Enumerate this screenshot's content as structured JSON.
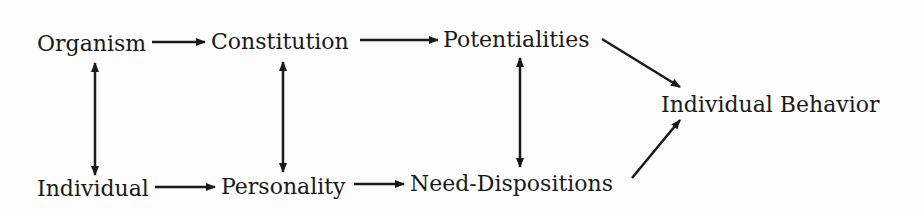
{
  "diagram": {
    "nodes": [
      {
        "id": "organism",
        "label": "Organism"
      },
      {
        "id": "constitution",
        "label": "Constitution"
      },
      {
        "id": "potentialities",
        "label": "Potentialities"
      },
      {
        "id": "individual_behavior",
        "label": "Individual Behavior"
      },
      {
        "id": "individual",
        "label": "Individual"
      },
      {
        "id": "personality",
        "label": "Personality"
      },
      {
        "id": "need_dispositions",
        "label": "Need-Dispositions"
      }
    ],
    "edges": [
      {
        "from": "organism",
        "to": "constitution",
        "type": "directed"
      },
      {
        "from": "constitution",
        "to": "potentialities",
        "type": "directed"
      },
      {
        "from": "potentialities",
        "to": "individual_behavior",
        "type": "directed"
      },
      {
        "from": "individual",
        "to": "personality",
        "type": "directed"
      },
      {
        "from": "personality",
        "to": "need_dispositions",
        "type": "directed"
      },
      {
        "from": "need_dispositions",
        "to": "individual_behavior",
        "type": "directed"
      },
      {
        "from": "organism",
        "to": "individual",
        "type": "bidirectional"
      },
      {
        "from": "constitution",
        "to": "personality",
        "type": "bidirectional"
      },
      {
        "from": "potentialities",
        "to": "need_dispositions",
        "type": "bidirectional"
      }
    ],
    "colors": {
      "ink": "#1a1a1a",
      "background": "#fdfdfd"
    }
  }
}
